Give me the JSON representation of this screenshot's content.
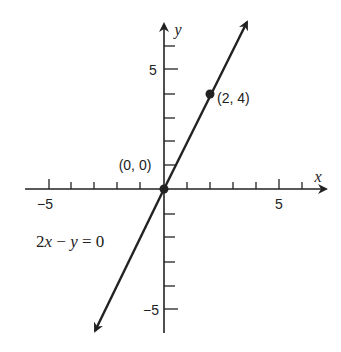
{
  "diagram": {
    "type": "coordinate-plane-line-graph",
    "equation_label": "2x − y = 0",
    "equation_parts": {
      "coef": "2",
      "x": "x",
      "minus": " − ",
      "y": "y",
      "eq": " = 0"
    },
    "axes": {
      "x_label": "x",
      "y_label": "y",
      "x_ticks": [
        -6,
        -5,
        -4,
        -3,
        -2,
        -1,
        1,
        2,
        3,
        4,
        5,
        6
      ],
      "y_ticks": [
        -5,
        -4,
        -3,
        -2,
        -1,
        1,
        2,
        3,
        4,
        5,
        6
      ],
      "x_tick_labels": {
        "neg": "−5",
        "pos": "5"
      },
      "y_tick_labels": {
        "pos": "5",
        "neg": "−5"
      }
    },
    "points": [
      {
        "x": 0,
        "y": 0,
        "label": "(0, 0)"
      },
      {
        "x": 2,
        "y": 4,
        "label": "(2, 4)"
      }
    ],
    "line": {
      "slope": 2,
      "intercept": 0
    },
    "colors": {
      "ink": "#222222",
      "background": "#ffffff"
    }
  }
}
